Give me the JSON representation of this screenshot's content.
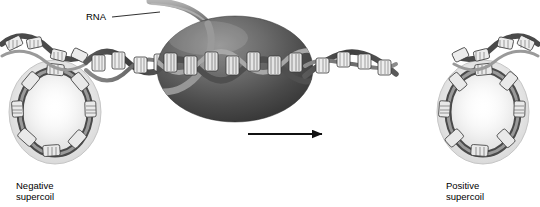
{
  "figure": {
    "width": 540,
    "height": 207,
    "background_color": "#ffffff"
  },
  "labels": {
    "rna": "RNA",
    "negative_supercoil_line1": "Negative",
    "negative_supercoil_line2": "supercoil",
    "positive_supercoil_line1": "Positive",
    "positive_supercoil_line2": "supercoil"
  },
  "colors": {
    "text": "#000000",
    "arrow": "#111111",
    "polymerase_dark": "#3d3d3d",
    "polymerase_mid": "#6e6e6e",
    "polymerase_light": "#9d9d9d",
    "dna_backbone_dark": "#4a4a4a",
    "dna_backbone_mid": "#7a7a7a",
    "dna_rung_light": "#e8e8e8",
    "halo_gray": "#d9d9d9",
    "rna_ribbon": "#8f8f8f",
    "leader_line": "#333333"
  },
  "elements": {
    "rna_polymerase": {
      "name": "RNA polymerase",
      "shape": "ellipse",
      "center_x": 235,
      "center_y": 69,
      "radius_x": 78,
      "radius_y": 53
    },
    "rna_transcript": {
      "name": "RNA transcript strand",
      "description": "light gray ribbon emerging from upper-left of polymerase curving up and left"
    },
    "direction_arrow": {
      "name": "transcription direction arrow",
      "direction": "right",
      "x_start": 248,
      "x_end": 331,
      "y": 134
    },
    "left_supercoil": {
      "name": "negative supercoil loop",
      "center_x": 55,
      "center_y": 113,
      "radius_x": 48,
      "radius_y": 52
    },
    "right_supercoil": {
      "name": "positive supercoil loop",
      "center_x": 483,
      "center_y": 113,
      "radius_x": 48,
      "radius_y": 52
    },
    "dna_duplex": {
      "name": "DNA double helix",
      "description": "double-stranded helix running horizontally across the figure with base-pair rungs"
    }
  }
}
